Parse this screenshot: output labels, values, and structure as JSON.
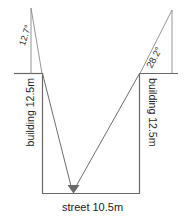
{
  "diagram": {
    "kind": "geometry-diagram",
    "top_clipped_text": "",
    "labels": {
      "angle_left": "12.7°",
      "angle_right": "28.2°",
      "building_left": "building 12.5m",
      "building_right": "building 12.5m",
      "street": "street 10.5m"
    },
    "values": {
      "angle_left_degrees": 12.7,
      "angle_right_degrees": 28.2,
      "building_left_height_m": 12.5,
      "building_right_height_m": 12.5,
      "street_width_m": 10.5
    },
    "colors": {
      "stroke": "#6f6f6f",
      "text": "#1d1d1d",
      "background": "#ffffff"
    },
    "marker": "arrowhead-down"
  }
}
